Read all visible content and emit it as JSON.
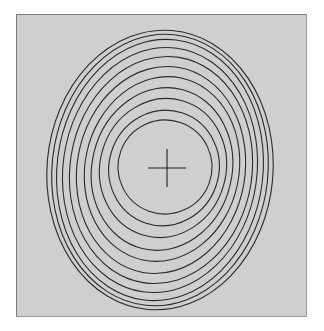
{
  "figure": {
    "background_color": "#cfcfcf",
    "stroke_color": "#2b2b2b",
    "center_marker": "plus-cross",
    "center": [
      167,
      168
    ],
    "cross_half_length": 19,
    "ellipses": [
      {
        "cx": 165,
        "cy": 167,
        "rx": 47,
        "ry": 47,
        "rot": 20
      },
      {
        "cx": 164,
        "cy": 168,
        "rx": 55,
        "ry": 58,
        "rot": 18
      },
      {
        "cx": 163,
        "cy": 168,
        "rx": 63,
        "ry": 70,
        "rot": 16
      },
      {
        "cx": 162,
        "cy": 169,
        "rx": 70,
        "ry": 82,
        "rot": 14
      },
      {
        "cx": 162,
        "cy": 169,
        "rx": 77,
        "ry": 93,
        "rot": 12
      },
      {
        "cx": 161,
        "cy": 170,
        "rx": 84,
        "ry": 104,
        "rot": 10
      },
      {
        "cx": 161,
        "cy": 170,
        "rx": 91,
        "ry": 114,
        "rot": 9
      },
      {
        "cx": 160,
        "cy": 170,
        "rx": 97,
        "ry": 123,
        "rot": 8
      },
      {
        "cx": 160,
        "cy": 170,
        "rx": 103,
        "ry": 131,
        "rot": 7
      },
      {
        "cx": 160,
        "cy": 170,
        "rx": 108,
        "ry": 136,
        "rot": 6
      },
      {
        "cx": 160,
        "cy": 170,
        "rx": 113,
        "ry": 140,
        "rot": 5
      }
    ]
  }
}
